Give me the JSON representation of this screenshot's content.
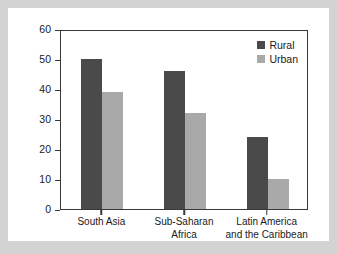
{
  "chart_data": {
    "type": "bar",
    "title": "",
    "subtitle": "",
    "xlabel": "",
    "ylabel": "",
    "ylim": [
      0,
      60
    ],
    "yticks": [
      0,
      10,
      20,
      30,
      40,
      50,
      60
    ],
    "ytick_labels": [
      "0",
      "10",
      "20",
      "30",
      "40",
      "50",
      "60"
    ],
    "grid": false,
    "legend_position": "top-right",
    "categories": [
      "South Asia",
      "Sub-Saharan Africa",
      "Latin America and the Caribbean"
    ],
    "category_label_lines": [
      [
        "South Asia"
      ],
      [
        "Sub-Saharan",
        "Africa"
      ],
      [
        "Latin America",
        "and the Caribbean"
      ]
    ],
    "series": [
      {
        "name": "Rural",
        "color": "#4a4a4a",
        "values": [
          50,
          46,
          24
        ]
      },
      {
        "name": "Urban",
        "color": "#a9a9a9",
        "values": [
          39,
          32,
          10
        ]
      }
    ]
  },
  "colors": {
    "page_background": "#d3d3d3",
    "panel_background": "#ffffff",
    "axis": "#3a3a3a",
    "text": "#1a1a1a",
    "rural": "#4a4a4a",
    "urban": "#a9a9a9"
  }
}
